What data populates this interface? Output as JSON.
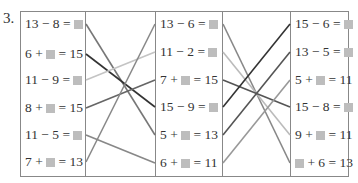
{
  "question_number": "3.",
  "columns": {
    "left": [
      {
        "parts": [
          "13 − 8 = ",
          "[]",
          ""
        ],
        "y": 24
      },
      {
        "parts": [
          "6 + ",
          "[]",
          " = 15"
        ],
        "y": 54
      },
      {
        "parts": [
          "11 − 9 = ",
          "[]",
          ""
        ],
        "y": 80
      },
      {
        "parts": [
          "8 + ",
          "[]",
          " = 15"
        ],
        "y": 108
      },
      {
        "parts": [
          "11 − 5 = ",
          "[]",
          ""
        ],
        "y": 135
      },
      {
        "parts": [
          "7 + ",
          "[]",
          " = 13"
        ],
        "y": 162
      }
    ],
    "middle": [
      {
        "parts": [
          "13 − 6 = ",
          "[]",
          ""
        ],
        "y": 24
      },
      {
        "parts": [
          "11 − 2 = ",
          "[]",
          ""
        ],
        "y": 52
      },
      {
        "parts": [
          "7 + ",
          "[]",
          " = 15"
        ],
        "y": 80
      },
      {
        "parts": [
          "15 − 9 = ",
          "[]",
          ""
        ],
        "y": 107
      },
      {
        "parts": [
          "5 + ",
          "[]",
          " = 13"
        ],
        "y": 135
      },
      {
        "parts": [
          "6 + ",
          "[]",
          " = 11"
        ],
        "y": 163
      }
    ],
    "right": [
      {
        "parts": [
          "15 − 6 = ",
          "[]",
          ""
        ],
        "y": 24
      },
      {
        "parts": [
          "13 − 5 = ",
          "[]",
          ""
        ],
        "y": 52
      },
      {
        "parts": [
          "5 + ",
          "[]",
          " = 11"
        ],
        "y": 80
      },
      {
        "parts": [
          "15 − 8 = ",
          "[]",
          ""
        ],
        "y": 107
      },
      {
        "parts": [
          "9 + ",
          "[]",
          " = 11"
        ],
        "y": 135
      },
      {
        "parts": [
          "",
          "[]",
          " + 6 = 13"
        ],
        "y": 163
      }
    ]
  },
  "connections_left_to_middle": [
    {
      "from": 0,
      "to": 4,
      "color": "#777777"
    },
    {
      "from": 1,
      "to": 3,
      "color": "#333333"
    },
    {
      "from": 2,
      "to": 1,
      "color": "#c4c4c4"
    },
    {
      "from": 3,
      "to": 2,
      "color": "#666666"
    },
    {
      "from": 4,
      "to": 5,
      "color": "#888888"
    },
    {
      "from": 5,
      "to": 0,
      "color": "#888888"
    }
  ],
  "connections_middle_to_right": [
    {
      "from": 0,
      "to": 5,
      "color": "#888888"
    },
    {
      "from": 1,
      "to": 4,
      "color": "#bbbbbb"
    },
    {
      "from": 2,
      "to": 3,
      "color": "#555555"
    },
    {
      "from": 3,
      "to": 0,
      "color": "#333333"
    },
    {
      "from": 4,
      "to": 1,
      "color": "#555555"
    },
    {
      "from": 5,
      "to": 2,
      "color": "#999999"
    }
  ],
  "colors": {
    "border": "#888888",
    "placeholder_box": "#bdbdbd",
    "text": "#333333"
  }
}
